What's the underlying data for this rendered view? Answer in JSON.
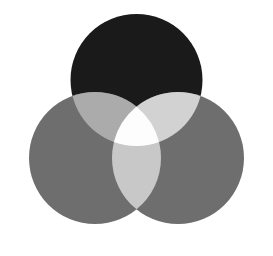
{
  "figure": {
    "background_color": "#ffffff",
    "width": 273,
    "height": 256
  },
  "chart_data": {
    "type": "venn",
    "subtitle": "",
    "xlabel": "",
    "ylabel": "",
    "grid": false,
    "legend_position": "none",
    "set_count": 3,
    "blend_mode": "additive-screen",
    "canvas": {
      "width": 273,
      "height": 256,
      "background": "#ffffff"
    },
    "sets": [
      {
        "id": "top",
        "name": "Top circle",
        "label": "",
        "cx": 136.5,
        "cy": 80,
        "r": 66,
        "color": "#1a1a1a"
      },
      {
        "id": "left",
        "name": "Lower-left circle",
        "label": "",
        "cx": 95,
        "cy": 158,
        "r": 66,
        "color": "#6e6e6e"
      },
      {
        "id": "right",
        "name": "Lower-right circle",
        "label": "",
        "cx": 178,
        "cy": 158,
        "r": 66,
        "color": "#6e6e6e"
      }
    ],
    "regions": [
      {
        "id": "top-only",
        "members": [
          "top"
        ],
        "color": "#1a1a1a",
        "label": ""
      },
      {
        "id": "left-only",
        "members": [
          "left"
        ],
        "color": "#6e6e6e",
        "label": ""
      },
      {
        "id": "right-only",
        "members": [
          "right"
        ],
        "color": "#6e6e6e",
        "label": ""
      },
      {
        "id": "top-left",
        "members": [
          "top",
          "left"
        ],
        "color": "#ababab",
        "label": ""
      },
      {
        "id": "top-right",
        "members": [
          "top",
          "right"
        ],
        "color": "#d2d2d2",
        "label": ""
      },
      {
        "id": "left-right",
        "members": [
          "left",
          "right"
        ],
        "color": "#c8c8c8",
        "label": ""
      },
      {
        "id": "all-three",
        "members": [
          "top",
          "left",
          "right"
        ],
        "color": "#fdfdfd",
        "label": ""
      }
    ],
    "annotations": []
  }
}
